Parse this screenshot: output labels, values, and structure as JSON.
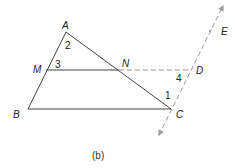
{
  "figure": {
    "caption": "(b)",
    "points": {
      "A": {
        "label": "A"
      },
      "B": {
        "label": "B"
      },
      "C": {
        "label": "C"
      },
      "M": {
        "label": "M"
      },
      "N": {
        "label": "N"
      },
      "D": {
        "label": "D"
      },
      "E": {
        "label": "E"
      }
    },
    "angles": {
      "a1": "1",
      "a2": "2",
      "a3": "3",
      "a4": "4"
    },
    "colors": {
      "solid_line": "#444444",
      "dashed_line": "#9a9a9a"
    }
  }
}
